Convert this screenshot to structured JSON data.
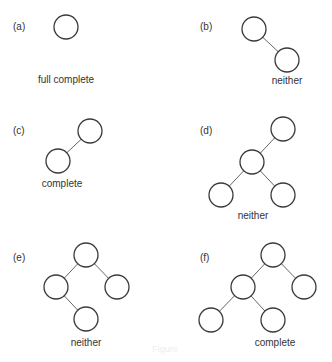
{
  "node_radius": 12,
  "colors": {
    "node_stroke": "#3a3a3a",
    "edge": "#666666",
    "text": "#333333"
  },
  "figure_caption": {
    "text": "Figure",
    "x": 165,
    "y": 352
  },
  "panels": [
    {
      "id": "a",
      "label": "(a)",
      "label_pos": [
        13,
        30
      ],
      "caption": "full complete",
      "caption_pos": [
        66,
        83
      ],
      "nodes": [
        [
          66,
          27
        ]
      ],
      "edges": []
    },
    {
      "id": "b",
      "label": "(b)",
      "label_pos": [
        200,
        30
      ],
      "caption": "neither",
      "caption_pos": [
        287,
        84
      ],
      "nodes": [
        [
          254,
          29
        ],
        [
          287,
          60
        ]
      ],
      "edges": [
        [
          0,
          1
        ]
      ]
    },
    {
      "id": "c",
      "label": "(c)",
      "label_pos": [
        13,
        134
      ],
      "caption": "complete",
      "caption_pos": [
        62,
        187
      ],
      "nodes": [
        [
          90,
          131
        ],
        [
          58,
          161
        ]
      ],
      "edges": [
        [
          0,
          1
        ]
      ]
    },
    {
      "id": "d",
      "label": "(d)",
      "label_pos": [
        200,
        134
      ],
      "caption": "neither",
      "caption_pos": [
        253,
        219
      ],
      "nodes": [
        [
          283,
          129
        ],
        [
          252,
          162
        ],
        [
          221,
          195
        ],
        [
          283,
          195
        ]
      ],
      "edges": [
        [
          0,
          1
        ],
        [
          1,
          2
        ],
        [
          1,
          3
        ]
      ]
    },
    {
      "id": "e",
      "label": "(e)",
      "label_pos": [
        13,
        261
      ],
      "caption": "neither",
      "caption_pos": [
        86,
        346
      ],
      "nodes": [
        [
          86,
          255
        ],
        [
          56,
          287
        ],
        [
          117,
          287
        ],
        [
          86,
          319
        ]
      ],
      "edges": [
        [
          0,
          1
        ],
        [
          0,
          2
        ],
        [
          1,
          3
        ]
      ]
    },
    {
      "id": "f",
      "label": "(f)",
      "label_pos": [
        200,
        261
      ],
      "caption": "complete",
      "caption_pos": [
        275,
        346
      ],
      "nodes": [
        [
          273,
          255
        ],
        [
          243,
          287
        ],
        [
          304,
          287
        ],
        [
          211,
          320
        ],
        [
          273,
          320
        ]
      ],
      "edges": [
        [
          0,
          1
        ],
        [
          0,
          2
        ],
        [
          1,
          3
        ],
        [
          1,
          4
        ]
      ]
    }
  ]
}
